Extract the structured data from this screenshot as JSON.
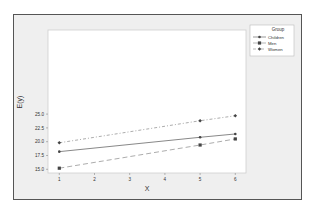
{
  "chart_data": {
    "type": "line",
    "title": "",
    "xlabel": "X",
    "ylabel": "E(y)",
    "x": [
      1,
      5,
      6
    ],
    "xticks": [
      1,
      2,
      3,
      4,
      5,
      6
    ],
    "yticks": [
      "15.0",
      "17.5",
      "20.0",
      "22.5",
      "25.0"
    ],
    "xlim": [
      0.7,
      6.3
    ],
    "ylim": [
      14.8,
      25.2
    ],
    "legend": {
      "title": "Group",
      "position": "right-top"
    },
    "series": [
      {
        "name": "Children",
        "values": [
          18.2,
          20.8,
          21.4
        ],
        "style": "solid",
        "marker": "circle",
        "color": "#444444"
      },
      {
        "name": "Men",
        "values": [
          15.2,
          19.4,
          20.5
        ],
        "style": "dashed",
        "marker": "square",
        "color": "#444444"
      },
      {
        "name": "Women",
        "values": [
          19.8,
          23.8,
          24.7
        ],
        "style": "dashdot",
        "marker": "diamond",
        "color": "#444444"
      }
    ]
  }
}
